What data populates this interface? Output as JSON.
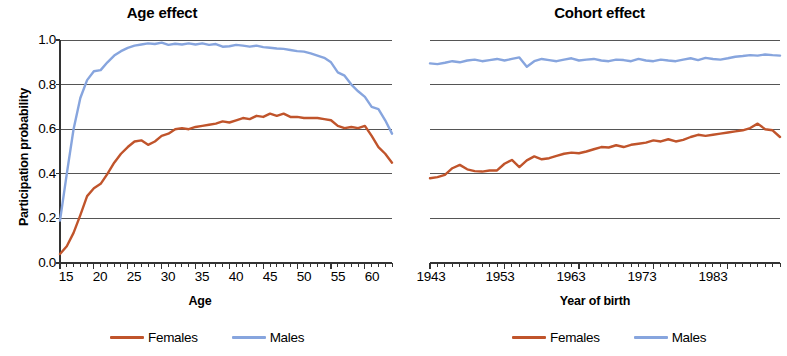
{
  "figure": {
    "background": "#ffffff",
    "series_colors": {
      "females": "#C0542B",
      "males": "#87A5DE"
    },
    "gridline_color": "#555555",
    "axis_color": "#333333"
  },
  "panels": {
    "age": {
      "title": "Age effect",
      "ylabel": "Participation probability",
      "xlabel": "Age",
      "yticks": [
        "1.0",
        "0.8",
        "0.6",
        "0.4",
        "0.2",
        "0.0"
      ],
      "xticks": [
        "15",
        "20",
        "25",
        "30",
        "35",
        "40",
        "45",
        "50",
        "55",
        "60"
      ],
      "legend": {
        "females": "Females",
        "males": "Males"
      }
    },
    "cohort": {
      "title": "Cohort effect",
      "xlabel": "Year of birth",
      "xticks": [
        "1943",
        "1953",
        "1963",
        "1973",
        "1983"
      ],
      "legend": {
        "females": "Females",
        "males": "Males"
      }
    }
  },
  "chart_data": [
    {
      "type": "line",
      "title": "Age effect",
      "xlabel": "Age",
      "ylabel": "Participation probability",
      "xlim": [
        15,
        64
      ],
      "ylim": [
        0.0,
        1.0
      ],
      "yticks": [
        0.0,
        0.2,
        0.4,
        0.6,
        0.8,
        1.0
      ],
      "xticks": [
        15,
        20,
        25,
        30,
        35,
        40,
        45,
        50,
        55,
        60
      ],
      "grid": true,
      "legend_position": "below",
      "x": [
        15,
        16,
        17,
        18,
        19,
        20,
        21,
        22,
        23,
        24,
        25,
        26,
        27,
        28,
        29,
        30,
        31,
        32,
        33,
        34,
        35,
        36,
        37,
        38,
        39,
        40,
        41,
        42,
        43,
        44,
        45,
        46,
        47,
        48,
        49,
        50,
        51,
        52,
        53,
        54,
        55,
        56,
        57,
        58,
        59,
        60,
        61,
        62,
        63,
        64
      ],
      "series": [
        {
          "name": "Females",
          "color": "#C0542B",
          "values": [
            0.04,
            0.075,
            0.135,
            0.215,
            0.3,
            0.335,
            0.355,
            0.4,
            0.45,
            0.49,
            0.52,
            0.545,
            0.55,
            0.53,
            0.545,
            0.57,
            0.58,
            0.6,
            0.605,
            0.6,
            0.61,
            0.615,
            0.62,
            0.625,
            0.635,
            0.63,
            0.64,
            0.65,
            0.645,
            0.66,
            0.655,
            0.67,
            0.66,
            0.67,
            0.655,
            0.655,
            0.65,
            0.65,
            0.65,
            0.645,
            0.64,
            0.615,
            0.605,
            0.61,
            0.605,
            0.615,
            0.57,
            0.52,
            0.49,
            0.45
          ],
          "last_value": 0.445
        },
        {
          "name": "Males",
          "color": "#87A5DE",
          "values": [
            0.19,
            0.4,
            0.6,
            0.74,
            0.82,
            0.86,
            0.865,
            0.9,
            0.93,
            0.95,
            0.965,
            0.975,
            0.98,
            0.985,
            0.982,
            0.988,
            0.978,
            0.983,
            0.98,
            0.985,
            0.98,
            0.985,
            0.978,
            0.982,
            0.97,
            0.972,
            0.978,
            0.975,
            0.97,
            0.975,
            0.968,
            0.965,
            0.962,
            0.96,
            0.955,
            0.95,
            0.948,
            0.94,
            0.93,
            0.92,
            0.9,
            0.855,
            0.84,
            0.8,
            0.77,
            0.745,
            0.7,
            0.69,
            0.64,
            0.58
          ],
          "last_value": 0.56
        }
      ]
    },
    {
      "type": "line",
      "title": "Cohort effect",
      "xlabel": "Year of birth",
      "ylabel": "",
      "xlim": [
        1943,
        1990
      ],
      "ylim": [
        0.0,
        1.0
      ],
      "yticks": [
        0.0,
        0.2,
        0.4,
        0.6,
        0.8,
        1.0
      ],
      "xticks": [
        1943,
        1953,
        1963,
        1973,
        1983
      ],
      "grid": true,
      "legend_position": "below",
      "x": [
        1943,
        1944,
        1945,
        1946,
        1947,
        1948,
        1949,
        1950,
        1951,
        1952,
        1953,
        1954,
        1955,
        1956,
        1957,
        1958,
        1959,
        1960,
        1961,
        1962,
        1963,
        1964,
        1965,
        1966,
        1967,
        1968,
        1969,
        1970,
        1971,
        1972,
        1973,
        1974,
        1975,
        1976,
        1977,
        1978,
        1979,
        1980,
        1981,
        1982,
        1983,
        1984,
        1985,
        1986,
        1987,
        1988,
        1989,
        1990
      ],
      "series": [
        {
          "name": "Females",
          "color": "#C0542B",
          "values": [
            0.38,
            0.385,
            0.395,
            0.425,
            0.44,
            0.42,
            0.412,
            0.41,
            0.415,
            0.415,
            0.445,
            0.462,
            0.43,
            0.46,
            0.478,
            0.465,
            0.47,
            0.48,
            0.49,
            0.495,
            0.492,
            0.5,
            0.51,
            0.52,
            0.518,
            0.528,
            0.52,
            0.53,
            0.535,
            0.54,
            0.55,
            0.545,
            0.555,
            0.545,
            0.552,
            0.565,
            0.575,
            0.57,
            0.575,
            0.58,
            0.585,
            0.59,
            0.595,
            0.605,
            0.625,
            0.6,
            0.595,
            0.565
          ],
          "last_value": 0.565
        },
        {
          "name": "Males",
          "color": "#87A5DE",
          "values": [
            0.895,
            0.892,
            0.898,
            0.905,
            0.9,
            0.908,
            0.912,
            0.905,
            0.91,
            0.915,
            0.908,
            0.915,
            0.922,
            0.88,
            0.905,
            0.915,
            0.91,
            0.905,
            0.912,
            0.918,
            0.908,
            0.912,
            0.915,
            0.908,
            0.905,
            0.912,
            0.91,
            0.905,
            0.915,
            0.908,
            0.905,
            0.912,
            0.908,
            0.905,
            0.912,
            0.918,
            0.91,
            0.92,
            0.915,
            0.912,
            0.918,
            0.925,
            0.928,
            0.932,
            0.93,
            0.935,
            0.932,
            0.93
          ],
          "last_value": 0.93
        }
      ]
    }
  ]
}
